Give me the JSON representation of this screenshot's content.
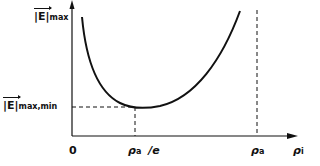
{
  "diagram": {
    "y_axis": {
      "label_main": "|E|",
      "label_sub": "max"
    },
    "x_axis": {
      "label_main": "ρ",
      "label_sub": "i",
      "origin": "0"
    },
    "markers": {
      "min_level_main": "|E|",
      "min_level_sub": "max,min",
      "rho_e_main": "ρ",
      "rho_e_sub": "a",
      "rho_e_suffix": "/e",
      "rho_a_main": "ρ",
      "rho_a_sub": "a"
    },
    "colors": {
      "line": "#111111",
      "background": "#ffffff"
    }
  }
}
